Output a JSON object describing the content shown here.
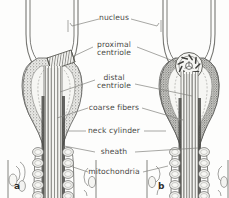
{
  "figure": {
    "type": "anatomical-diagram",
    "background_color": "#fdfdfc",
    "ink_color": "#6b6b68",
    "text_color": "#4a4a48",
    "panels": [
      {
        "id": "a",
        "label": "a",
        "x": 14,
        "y": 181
      },
      {
        "id": "b",
        "label": "b",
        "x": 158,
        "y": 181
      }
    ],
    "labels": [
      {
        "name": "nucleus",
        "text": "nucleus",
        "lines": [
          "nucleus"
        ],
        "x": 114,
        "y": 19
      },
      {
        "name": "proximal-centriole",
        "text": "proximal centriole",
        "lines": [
          "proximal",
          "centriole"
        ],
        "x": 114,
        "y": 50
      },
      {
        "name": "distal-centriole",
        "text": "distal centriole",
        "lines": [
          "distal",
          "centriole"
        ],
        "x": 114,
        "y": 83
      },
      {
        "name": "coarse-fibers",
        "text": "coarse fibers",
        "lines": [
          "coarse fibers"
        ],
        "x": 114,
        "y": 108
      },
      {
        "name": "neck-cylinder",
        "text": "neck cylinder",
        "lines": [
          "neck cylinder"
        ],
        "x": 114,
        "y": 131
      },
      {
        "name": "sheath",
        "text": "sheath",
        "lines": [
          "sheath"
        ],
        "x": 114,
        "y": 152
      },
      {
        "name": "mitochondria",
        "text": "mitochondria",
        "lines": [
          "mitochondria"
        ],
        "x": 114,
        "y": 172
      }
    ]
  }
}
